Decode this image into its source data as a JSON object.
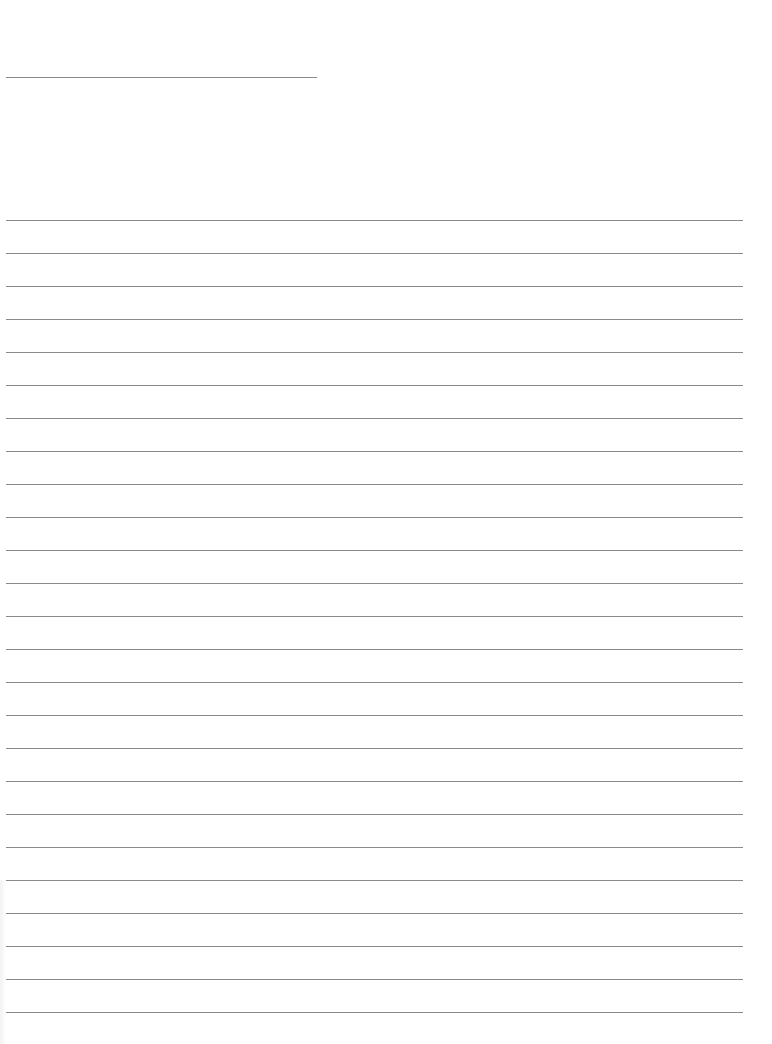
{
  "document": {
    "type": "lined-paper",
    "header_line": {
      "x": 6,
      "y": 77,
      "width": 311
    },
    "ruled_lines": {
      "count": 25,
      "start_y": 220,
      "spacing": 33,
      "x": 6,
      "width": 737
    },
    "colors": {
      "paper": "#ffffff",
      "line": "#8a8a8a"
    }
  }
}
